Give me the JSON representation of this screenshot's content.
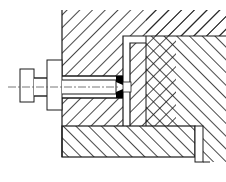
{
  "figure": {
    "type": "mechanical-cross-section",
    "colors": {
      "background": "#ffffff",
      "line": "#1a1a1a",
      "hatch": "#1a1a1a",
      "centerline": "#555555",
      "fill_solid": "#000000"
    }
  },
  "parts": [
    {
      "id": "upper-body",
      "label": "Upper body (hatched /)"
    },
    {
      "id": "bolt",
      "label": "Bolt with head and flange"
    },
    {
      "id": "l-insert",
      "label": "L-shaped insert"
    },
    {
      "id": "wedge-block",
      "label": "Wedge block (chevron hatch)"
    },
    {
      "id": "right-body",
      "label": "Right body (hatched \\)"
    },
    {
      "id": "base-plate",
      "label": "Base plate (hatched \\)"
    },
    {
      "id": "end-strip",
      "label": "Right end strip"
    },
    {
      "id": "weld",
      "label": "Solid weld/seal"
    },
    {
      "id": "centerline",
      "label": "Bolt axis centerline"
    }
  ]
}
